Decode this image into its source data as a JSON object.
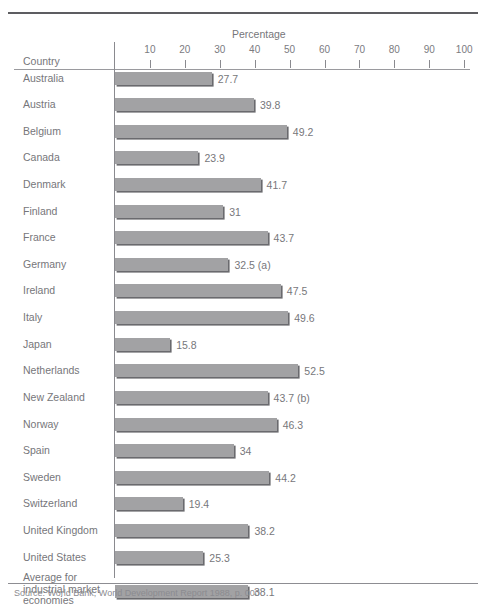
{
  "figure": {
    "axis_title": "Percentage",
    "country_column_header": "Country",
    "source_note": "Source: World Bank, World Development Report 1988, p. 000"
  },
  "chart_data": {
    "type": "bar",
    "orientation": "horizontal",
    "title": "Percentage",
    "xlabel": "Percentage",
    "ylabel": "Country",
    "xlim": [
      0,
      100
    ],
    "xticks": [
      10,
      20,
      30,
      40,
      50,
      60,
      70,
      80,
      90,
      100
    ],
    "grid": false,
    "legend": "none",
    "categories": [
      "Australia",
      "Austria",
      "Belgium",
      "Canada",
      "Denmark",
      "Finland",
      "France",
      "Germany",
      "Ireland",
      "Italy",
      "Japan",
      "Netherlands",
      "New Zealand",
      "Norway",
      "Spain",
      "Sweden",
      "Switzerland",
      "United Kingdom",
      "United States",
      "Average for industrial market economies"
    ],
    "values": [
      27.7,
      39.8,
      49.2,
      23.9,
      41.7,
      31,
      43.7,
      32.5,
      47.5,
      49.6,
      15.8,
      52.5,
      43.7,
      46.3,
      34,
      44.2,
      19.4,
      38.2,
      25.3,
      38.1
    ],
    "data_labels": [
      "27.7",
      "39.8",
      "49.2",
      "23.9",
      "41.7",
      "31",
      "43.7",
      "32.5  (a)",
      "47.5",
      "49.6",
      "15.8",
      "52.5",
      "43.7  (b)",
      "46.3",
      "34",
      "44.2",
      "19.4",
      "38.2",
      "25.3",
      "38.1"
    ],
    "annotations": [
      "(a)",
      "(b)"
    ],
    "bar_color": "#a2a2a4",
    "bar_edge_color": "#6a6a6e"
  },
  "rows": [
    {
      "label": "Australia",
      "value": 27.7,
      "value_label": "27.7"
    },
    {
      "label": "Austria",
      "value": 39.8,
      "value_label": "39.8"
    },
    {
      "label": "Belgium",
      "value": 49.2,
      "value_label": "49.2"
    },
    {
      "label": "Canada",
      "value": 23.9,
      "value_label": "23.9"
    },
    {
      "label": "Denmark",
      "value": 41.7,
      "value_label": "41.7"
    },
    {
      "label": "Finland",
      "value": 31,
      "value_label": "31"
    },
    {
      "label": "France",
      "value": 43.7,
      "value_label": "43.7"
    },
    {
      "label": "Germany",
      "value": 32.5,
      "value_label": "32.5  (a)"
    },
    {
      "label": "Ireland",
      "value": 47.5,
      "value_label": "47.5"
    },
    {
      "label": "Italy",
      "value": 49.6,
      "value_label": "49.6"
    },
    {
      "label": "Japan",
      "value": 15.8,
      "value_label": "15.8"
    },
    {
      "label": "Netherlands",
      "value": 52.5,
      "value_label": "52.5"
    },
    {
      "label": "New Zealand",
      "value": 43.7,
      "value_label": "43.7  (b)"
    },
    {
      "label": "Norway",
      "value": 46.3,
      "value_label": "46.3"
    },
    {
      "label": "Spain",
      "value": 34,
      "value_label": "34"
    },
    {
      "label": "Sweden",
      "value": 44.2,
      "value_label": "44.2"
    },
    {
      "label": "Switzerland",
      "value": 19.4,
      "value_label": "19.4"
    },
    {
      "label": "United Kingdom",
      "value": 38.2,
      "value_label": "38.2"
    },
    {
      "label": "United States",
      "value": 25.3,
      "value_label": "25.3"
    },
    {
      "label": "Average for industrial market economies",
      "value": 38.1,
      "value_label": "38.1",
      "multiline": true
    }
  ],
  "axis": {
    "ticks": [
      "10",
      "20",
      "30",
      "40",
      "50",
      "60",
      "70",
      "80",
      "90",
      "100"
    ]
  }
}
